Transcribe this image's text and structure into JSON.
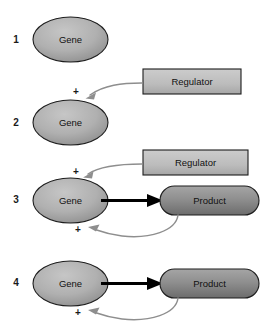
{
  "figure": {
    "background_color": "#ffffff",
    "colors": {
      "gene_fill_light": "#b9b9b9",
      "gene_fill_dark": "#8d8d8d",
      "product_fill_light": "#9a9a9a",
      "product_fill_dark": "#6f6f6f",
      "regulator_fill_light": "#c9c9c9",
      "regulator_fill_dark": "#a9a9a9",
      "outline": "#1d1d1d",
      "black_arrow": "#000000",
      "gray_arrow": "#8e8e8e",
      "text": "#111111"
    }
  },
  "panels": [
    {
      "number": "1",
      "nodes": {
        "gene": "Gene"
      },
      "signs": [],
      "arrows": []
    },
    {
      "number": "2",
      "nodes": {
        "gene": "Gene",
        "regulator": "Regulator"
      },
      "signs": [
        "+"
      ],
      "arrows": [
        {
          "name": "regulator-to-gene",
          "style": "gray-curved",
          "from": "regulator",
          "to": "gene"
        }
      ]
    },
    {
      "number": "3",
      "nodes": {
        "gene": "Gene",
        "regulator": "Regulator",
        "product": "Product"
      },
      "signs": [
        "+",
        "+"
      ],
      "arrows": [
        {
          "name": "regulator-to-gene",
          "style": "gray-curved",
          "from": "regulator",
          "to": "gene"
        },
        {
          "name": "gene-to-product",
          "style": "black-straight",
          "from": "gene",
          "to": "product"
        },
        {
          "name": "product-to-gene-feedback",
          "style": "gray-curved",
          "from": "product",
          "to": "gene"
        }
      ]
    },
    {
      "number": "4",
      "nodes": {
        "gene": "Gene",
        "product": "Product"
      },
      "signs": [
        "+"
      ],
      "arrows": [
        {
          "name": "gene-to-product",
          "style": "black-straight",
          "from": "gene",
          "to": "product"
        },
        {
          "name": "product-to-gene-feedback",
          "style": "gray-curved",
          "from": "product",
          "to": "gene"
        }
      ]
    }
  ],
  "labels": {
    "gene": "Gene",
    "product": "Product",
    "regulator": "Regulator",
    "plus": "+",
    "n1": "1",
    "n2": "2",
    "n3": "3",
    "n4": "4"
  }
}
